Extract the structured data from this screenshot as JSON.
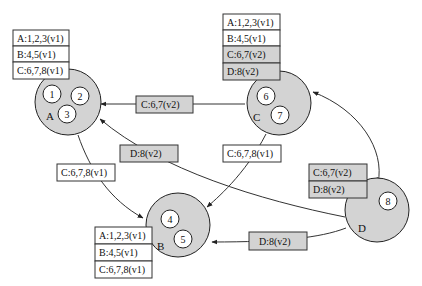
{
  "nodes": {
    "A": {
      "label": "A",
      "items": [
        "1",
        "2",
        "3"
      ]
    },
    "B": {
      "label": "B",
      "items": [
        "4",
        "5"
      ]
    },
    "C": {
      "label": "C",
      "items": [
        "6",
        "7"
      ]
    },
    "D": {
      "label": "D",
      "items": [
        "8"
      ]
    }
  },
  "tables": {
    "A": [
      "A:1,2,3(v1)",
      "B:4,5(v1)",
      "C:6,7,8(v1)"
    ],
    "B": [
      "A:1,2,3(v1)",
      "B:4,5(v1)",
      "C:6,7,8(v1)"
    ],
    "C": [
      "A:1,2,3(v1)",
      "B:4,5(v1)",
      "C:6,7(v2)",
      "D:8(v2)"
    ],
    "D": [
      "C:6,7(v2)",
      "D:8(v2)"
    ]
  },
  "edges": {
    "c_to_a": "C:6,7(v2)",
    "d_to_a": "D:8(v2)",
    "a_to_b": "C:6,7,8(v1)",
    "c_to_b": "C:6,7,8(v1)",
    "d_to_b": "D:8(v2)"
  },
  "colors": {
    "node_fill": "#d3d3d3",
    "updated_fill": "#d3d3d3",
    "old_fill": "#ffffff"
  }
}
